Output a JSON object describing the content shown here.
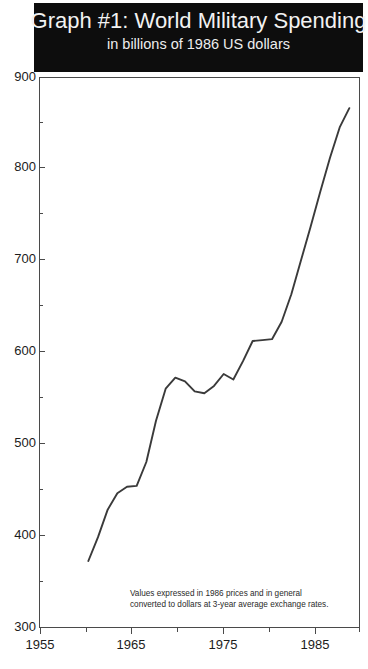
{
  "title": {
    "main": "Graph #1: World Military Spending",
    "subtitle": "in billions of 1986 US dollars"
  },
  "footnote": {
    "line1": "Values expressed in 1986 prices and in general",
    "line2": "converted to dollars at 3-year average exchange rates."
  },
  "colors": {
    "banner_background": "#0d0d0d",
    "banner_text": "#f2f2f2",
    "line": "#3a3a3a",
    "axis": "#4a4a4a",
    "plot_background": "#ffffff",
    "tick_text": "#1c1c1c"
  },
  "axes": {
    "y_ticks": [
      "900",
      "800",
      "700",
      "600",
      "500",
      "400",
      "300"
    ],
    "x_ticks": [
      "1955",
      "1965",
      "1975",
      "1985"
    ]
  },
  "chart_data": {
    "type": "line",
    "title": "Graph #1: World Military Spending",
    "subtitle": "in billions of 1986 US dollars",
    "xlabel": "",
    "ylabel": "",
    "xlim": [
      1955,
      1988
    ],
    "ylim": [
      300,
      900
    ],
    "y_ticks": [
      300,
      400,
      500,
      600,
      700,
      800,
      900
    ],
    "y_minor_ticks": [
      350,
      450,
      550,
      650,
      750,
      850
    ],
    "x_ticks": [
      1955,
      1965,
      1975,
      1985
    ],
    "x_minor_ticks": [
      1960,
      1970,
      1980
    ],
    "grid": false,
    "legend": null,
    "annotations": [
      "Values expressed in 1986 prices and in general converted to dollars at 3-year average exchange rates."
    ],
    "series": [
      {
        "name": "World Military Spending",
        "x": [
          1960,
          1961,
          1962,
          1963,
          1964,
          1965,
          1966,
          1967,
          1968,
          1969,
          1970,
          1971,
          1972,
          1973,
          1974,
          1975,
          1976,
          1977,
          1978,
          1979,
          1980,
          1981,
          1982,
          1983,
          1984,
          1985,
          1986,
          1987
        ],
        "values": [
          372,
          398,
          428,
          446,
          453,
          454,
          480,
          525,
          560,
          572,
          568,
          557,
          555,
          563,
          576,
          570,
          590,
          612,
          613,
          614,
          633,
          663,
          700,
          737,
          775,
          812,
          845,
          866
        ]
      }
    ]
  }
}
